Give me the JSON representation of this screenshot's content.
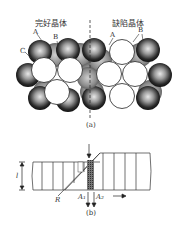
{
  "figure": {
    "part_a": {
      "left_title": "完好晶体",
      "right_title": "缺陷晶体",
      "labels_left": [
        "A",
        "B",
        "C"
      ],
      "labels_right": [
        "A",
        "B"
      ],
      "caption": "(a)"
    },
    "part_b": {
      "thickness_label": "l",
      "R_label": "R",
      "A1_label": "A₁",
      "A2_label": "A₂",
      "caption": "(b)"
    }
  }
}
